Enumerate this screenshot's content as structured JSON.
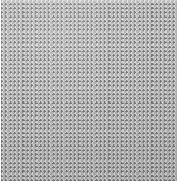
{
  "image": {
    "subject": "woven mesh fabric texture",
    "description": "Close-up photograph of a gray plain-weave mesh screen fabric filling the frame",
    "weave_type": "plain weave",
    "width_px": 180,
    "height_px": 191,
    "background_color": "#ffffff"
  },
  "swatch": {
    "label": "woven mesh swatch",
    "left_px": 1,
    "top_px": 0,
    "width_px": 176,
    "height_px": 181,
    "thread_period_px": 4.3,
    "threads_horizontal": 42,
    "threads_vertical": 41
  },
  "colors": {
    "thread_highlight": "#dfdfdf",
    "thread_midtone": "#cecece",
    "thread_shadow": "#afafaf",
    "gap_shadow": "#6e6e6e",
    "base": "#adadad",
    "page_background": "#ffffff"
  },
  "margins": {
    "right_label": "right white margin",
    "right_px": 3,
    "bottom_label": "bottom white margin",
    "bottom_px": 10,
    "left_label": "left white margin",
    "left_px": 1
  }
}
